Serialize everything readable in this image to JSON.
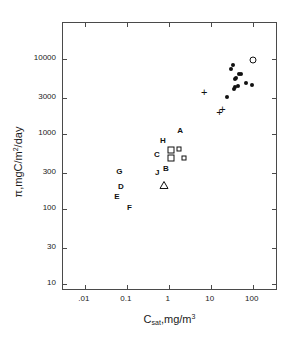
{
  "chart_data": {
    "type": "scatter",
    "title": "",
    "xlabel": "C_sat, mg/m^3",
    "ylabel": "pi, mgC/m^2/day",
    "xscale": "log",
    "yscale": "log",
    "xlim": [
      0.003,
      400
    ],
    "ylim": [
      8,
      30000
    ],
    "grid": false,
    "legend": "none",
    "x_ticks": [
      {
        "value": 0.01,
        "label": ".01"
      },
      {
        "value": 0.1,
        "label": "0.1"
      },
      {
        "value": 1,
        "label": "1"
      },
      {
        "value": 10,
        "label": "10"
      },
      {
        "value": 100,
        "label": "100"
      }
    ],
    "y_ticks": [
      {
        "value": 10,
        "label": "10"
      },
      {
        "value": 30,
        "label": "30"
      },
      {
        "value": 100,
        "label": "100"
      },
      {
        "value": 300,
        "label": "300"
      },
      {
        "value": 1000,
        "label": "1000"
      },
      {
        "value": 3000,
        "label": "3000"
      },
      {
        "value": 10000,
        "label": "10000"
      }
    ],
    "series": [
      {
        "name": "filled-circles",
        "marker": "filled-circle",
        "points": [
          {
            "x": 30.0,
            "y": 7200
          },
          {
            "x": 34.0,
            "y": 8300
          },
          {
            "x": 37.0,
            "y": 5300
          },
          {
            "x": 41.0,
            "y": 5500
          },
          {
            "x": 44.0,
            "y": 4400
          },
          {
            "x": 47.0,
            "y": 6300
          },
          {
            "x": 52.0,
            "y": 6200
          },
          {
            "x": 38.0,
            "y": 4200
          },
          {
            "x": 36.0,
            "y": 3900
          },
          {
            "x": 70.0,
            "y": 4700
          },
          {
            "x": 95.0,
            "y": 4500
          },
          {
            "x": 24.0,
            "y": 3100
          }
        ]
      },
      {
        "name": "open-circle",
        "marker": "open-circle",
        "points": [
          {
            "x": 100.0,
            "y": 9500
          }
        ]
      },
      {
        "name": "plus-markers",
        "marker": "plus",
        "points": [
          {
            "x": 7.0,
            "y": 3600
          },
          {
            "x": 16.0,
            "y": 1950
          },
          {
            "x": 19.0,
            "y": 2150
          }
        ]
      },
      {
        "name": "open-squares",
        "marker": "open-square",
        "points": [
          {
            "x": 1.15,
            "y": 610
          },
          {
            "x": 1.15,
            "y": 480
          },
          {
            "x": 1.7,
            "y": 620
          },
          {
            "x": 2.3,
            "y": 480
          }
        ]
      },
      {
        "name": "open-triangle",
        "marker": "open-triangle",
        "points": [
          {
            "x": 0.78,
            "y": 210
          }
        ]
      },
      {
        "name": "lettered-stations",
        "marker": "text-label",
        "points": [
          {
            "label": "A",
            "x": 1.85,
            "y": 1100
          },
          {
            "label": "B",
            "x": 0.85,
            "y": 340
          },
          {
            "label": "C",
            "x": 0.52,
            "y": 520
          },
          {
            "label": "D",
            "x": 0.072,
            "y": 195
          },
          {
            "label": "E",
            "x": 0.058,
            "y": 145
          },
          {
            "label": "F",
            "x": 0.115,
            "y": 102
          },
          {
            "label": "G",
            "x": 0.066,
            "y": 310
          },
          {
            "label": "H",
            "x": 0.72,
            "y": 790
          },
          {
            "label": "J",
            "x": 0.53,
            "y": 300
          }
        ]
      }
    ]
  },
  "axes": {
    "x_title_main": "C",
    "x_title_sub": "sat",
    "x_title_rest": ",mg/m",
    "x_title_sup": "3",
    "y_title_main": "π,mgC/m",
    "y_title_sup": "2",
    "y_title_rest": "/day"
  }
}
